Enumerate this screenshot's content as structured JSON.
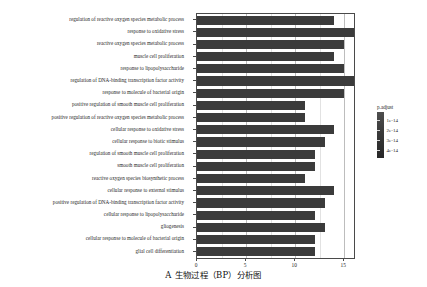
{
  "chart_data": {
    "type": "bar",
    "orientation": "horizontal",
    "title": "",
    "caption": "A  生物过程（BP）分析图",
    "xlabel": "",
    "ylabel": "",
    "xlim": [
      0,
      16.0
    ],
    "xticks": [
      0,
      5,
      10,
      15
    ],
    "xtick_labels": [
      "0",
      "5",
      "10",
      "15"
    ],
    "grid": true,
    "bar_color": "#3b3b3b",
    "categories": [
      "regulation of reactive oxygen species metabolic process",
      "response to oxidative stress",
      "reactive oxygen species metabolic process",
      "muscle cell proliferation",
      "response to lipopolysaccharide",
      "regulation of DNA-binding transcription factor activity",
      "response to molecule of bacterial origin",
      "positive regulation of smooth muscle cell proliferation",
      "positive regulation of reactive oxygen species metabolic process",
      "cellular response to oxidative stress",
      "cellular response to biotic stimulus",
      "regulation of smooth muscle cell proliferation",
      "smooth muscle cell proliferation",
      "reactive oxygen species biosynthetic process",
      "cellular response to external stimulus",
      "positive regulation of DNA-binding transcription factor activity",
      "cellular response to lipopolysaccharide",
      "gliogenesis",
      "cellular response to molecule of bacterial origin",
      "glial cell differentiation"
    ],
    "values": [
      14,
      17,
      15,
      14,
      15,
      16,
      15,
      11,
      11,
      14,
      13,
      12,
      12,
      11,
      14,
      13,
      12,
      13,
      12,
      12
    ],
    "legend": {
      "title": "p.adjust",
      "position": "right",
      "ticks": [
        "1e-14",
        "2e-14",
        "3e-14",
        "4e-14"
      ],
      "gradient_high": "#4f4f4f",
      "gradient_low": "#272727"
    }
  }
}
